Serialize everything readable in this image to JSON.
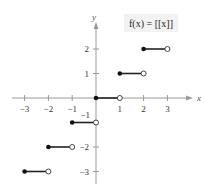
{
  "chart_data": {
    "type": "line",
    "title": "f(x) = [[x]]",
    "function": "greatest integer function",
    "xlabel": "x",
    "ylabel": "y",
    "xlim": [
      -3.5,
      3.8
    ],
    "ylim": [
      -3.5,
      3.5
    ],
    "x_ticks": [
      -3,
      -2,
      -1,
      1,
      2,
      3
    ],
    "x_tick_labels": [
      "−3",
      "−2",
      "−1",
      "1",
      "2",
      "3"
    ],
    "y_ticks": [
      2,
      1,
      -1,
      -2,
      -3
    ],
    "y_tick_labels": [
      "2",
      "1",
      "−1",
      "−2",
      "−3"
    ],
    "grid": false,
    "segments": [
      {
        "x_start": -3,
        "x_end": -2,
        "y": -3,
        "start_closed": true,
        "end_closed": false
      },
      {
        "x_start": -2,
        "x_end": -1,
        "y": -2,
        "start_closed": true,
        "end_closed": false
      },
      {
        "x_start": -1,
        "x_end": 0,
        "y": -1,
        "start_closed": true,
        "end_closed": false
      },
      {
        "x_start": 0,
        "x_end": 1,
        "y": 0,
        "start_closed": true,
        "end_closed": false
      },
      {
        "x_start": 1,
        "x_end": 2,
        "y": 1,
        "start_closed": true,
        "end_closed": false
      },
      {
        "x_start": 2,
        "x_end": 3,
        "y": 2,
        "start_closed": true,
        "end_closed": false
      }
    ]
  },
  "colors": {
    "axis": "#9a9a9a",
    "segment": "#222222",
    "closed_dot": "#111111",
    "open_dot_stroke": "#444444",
    "title_bg": "#f2f2f2"
  }
}
